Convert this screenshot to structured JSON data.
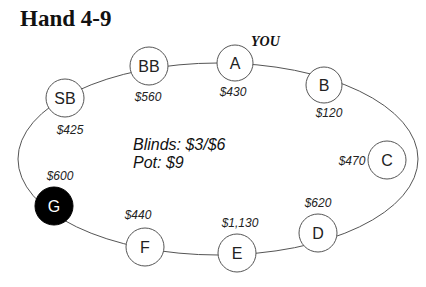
{
  "title": "Hand 4-9",
  "you_label": "YOU",
  "info": {
    "blinds": "Blinds: $3/$6",
    "pot": "Pot: $9"
  },
  "seats": [
    {
      "id": "SB",
      "label": "SB",
      "stack": "$425",
      "hero": false,
      "filled": false
    },
    {
      "id": "BB",
      "label": "BB",
      "stack": "$560",
      "hero": false,
      "filled": false
    },
    {
      "id": "A",
      "label": "A",
      "stack": "$430",
      "hero": true,
      "filled": false
    },
    {
      "id": "B",
      "label": "B",
      "stack": "$120",
      "hero": false,
      "filled": false
    },
    {
      "id": "C",
      "label": "C",
      "stack": "$470",
      "hero": false,
      "filled": false
    },
    {
      "id": "D",
      "label": "D",
      "stack": "$620",
      "hero": false,
      "filled": false
    },
    {
      "id": "E",
      "label": "E",
      "stack": "$1,130",
      "hero": false,
      "filled": false
    },
    {
      "id": "F",
      "label": "F",
      "stack": "$440",
      "hero": false,
      "filled": false
    },
    {
      "id": "G",
      "label": "G",
      "stack": "$600",
      "hero": false,
      "filled": true
    }
  ],
  "colors": {
    "line": "#555555",
    "filled_seat": "#000000",
    "seat_fill": "#ffffff"
  }
}
